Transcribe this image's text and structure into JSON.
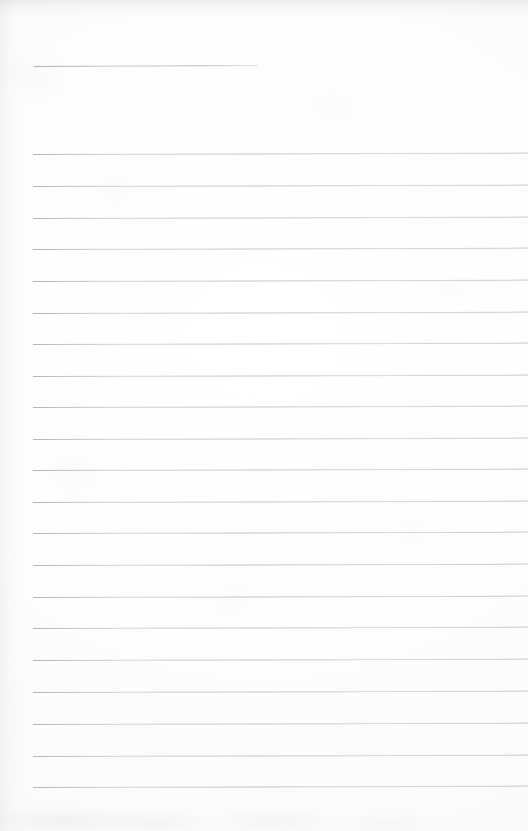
{
  "page": {
    "kind": "scanned-ruled-notebook-page",
    "width": 528,
    "height": 831,
    "background_color": "#fdfdfd",
    "rule_color": "#bfc4ca",
    "content_text": "",
    "note": "blank lined writing sheet with no handwriting or printed text"
  },
  "header_rule": {
    "x": 34,
    "y": 66,
    "width": 224,
    "tilt_deg": -0.25
  },
  "rules": [
    {
      "y": 154,
      "x": 33,
      "tilt_deg": -0.16
    },
    {
      "y": 186,
      "x": 33,
      "tilt_deg": -0.16
    },
    {
      "y": 218,
      "x": 33,
      "tilt_deg": -0.16
    },
    {
      "y": 249,
      "x": 33,
      "tilt_deg": -0.16
    },
    {
      "y": 281,
      "x": 33,
      "tilt_deg": -0.16
    },
    {
      "y": 313,
      "x": 33,
      "tilt_deg": -0.16
    },
    {
      "y": 344,
      "x": 33,
      "tilt_deg": -0.16
    },
    {
      "y": 376,
      "x": 33,
      "tilt_deg": -0.16
    },
    {
      "y": 407,
      "x": 33,
      "tilt_deg": -0.16
    },
    {
      "y": 439,
      "x": 33,
      "tilt_deg": -0.16
    },
    {
      "y": 470,
      "x": 33,
      "tilt_deg": -0.16
    },
    {
      "y": 502,
      "x": 33,
      "tilt_deg": -0.16
    },
    {
      "y": 533,
      "x": 33,
      "tilt_deg": -0.16
    },
    {
      "y": 565,
      "x": 33,
      "tilt_deg": -0.16
    },
    {
      "y": 597,
      "x": 33,
      "tilt_deg": -0.16
    },
    {
      "y": 628,
      "x": 33,
      "tilt_deg": -0.16
    },
    {
      "y": 660,
      "x": 33,
      "tilt_deg": -0.16
    },
    {
      "y": 692,
      "x": 33,
      "tilt_deg": -0.16
    },
    {
      "y": 724,
      "x": 33,
      "tilt_deg": -0.16
    },
    {
      "y": 756,
      "x": 33,
      "tilt_deg": -0.16
    },
    {
      "y": 787,
      "x": 33,
      "tilt_deg": -0.16
    }
  ]
}
